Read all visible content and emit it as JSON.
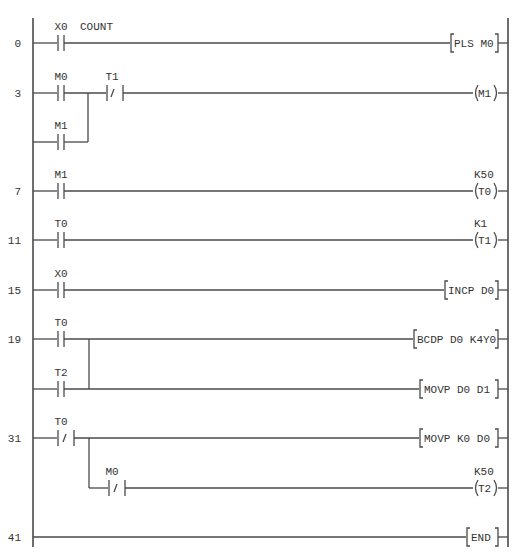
{
  "diagram": {
    "type": "PLC ladder diagram",
    "colors": {
      "line": "#4a4a4a",
      "text": "#333333",
      "background": "#ffffff"
    },
    "rungs": [
      {
        "step": "0",
        "contacts": [
          {
            "label": "X0",
            "type": "NO",
            "comment": "COUNT"
          }
        ],
        "output": {
          "kind": "instruction",
          "text": "PLS M0"
        }
      },
      {
        "step": "3",
        "contacts": [
          {
            "label": "M0",
            "type": "NO"
          },
          {
            "label": "T1",
            "type": "NC"
          }
        ],
        "branch": [
          {
            "label": "M1",
            "type": "NO"
          }
        ],
        "output": {
          "kind": "coil",
          "text": "M1"
        }
      },
      {
        "step": "7",
        "contacts": [
          {
            "label": "M1",
            "type": "NO"
          }
        ],
        "output": {
          "kind": "coil",
          "text": "T0",
          "setting": "K50"
        }
      },
      {
        "step": "11",
        "contacts": [
          {
            "label": "T0",
            "type": "NO"
          }
        ],
        "output": {
          "kind": "coil",
          "text": "T1",
          "setting": "K1"
        }
      },
      {
        "step": "15",
        "contacts": [
          {
            "label": "X0",
            "type": "NO"
          }
        ],
        "output": {
          "kind": "instruction",
          "text": "INCP D0"
        }
      },
      {
        "step": "19",
        "contacts": [
          {
            "label": "T0",
            "type": "NO"
          }
        ],
        "output": {
          "kind": "instruction",
          "text": "BCDP D0 K4Y0"
        },
        "second": {
          "contacts": [
            {
              "label": "T2",
              "type": "NO"
            }
          ],
          "output": {
            "kind": "instruction",
            "text": "MOVP D0 D1"
          }
        }
      },
      {
        "step": "31",
        "contacts": [
          {
            "label": "T0",
            "type": "NC"
          }
        ],
        "output": {
          "kind": "instruction",
          "text": "MOVP K0 D0"
        },
        "second": {
          "contacts": [
            {
              "label": "M0",
              "type": "NC"
            }
          ],
          "output": {
            "kind": "coil",
            "text": "T2",
            "setting": "K50"
          }
        }
      },
      {
        "step": "41",
        "contacts": [],
        "output": {
          "kind": "instruction",
          "text": "END"
        }
      }
    ]
  }
}
